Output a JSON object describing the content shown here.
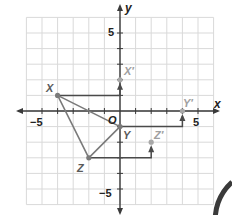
{
  "figure": {
    "axes": {
      "x_label": "x",
      "y_label": "y",
      "origin_label": "O",
      "x_range": [
        -6,
        6
      ],
      "y_range": [
        -6,
        6
      ],
      "tick_labels": {
        "x_neg": "−5",
        "x_pos": "5",
        "y_pos": "5",
        "y_neg": "−5"
      }
    },
    "preimage": {
      "name": "triangle XYZ",
      "points": [
        {
          "label": "X",
          "x": -4,
          "y": 1
        },
        {
          "label": "Y",
          "x": 0,
          "y": -1
        },
        {
          "label": "Z",
          "x": -2,
          "y": -3
        }
      ]
    },
    "image": {
      "points": [
        {
          "label": "X′",
          "x": 0,
          "y": 2
        },
        {
          "label": "Y′",
          "x": 4,
          "y": 0
        },
        {
          "label": "Z′",
          "x": 2,
          "y": -2
        }
      ]
    },
    "translation": {
      "horizontal": 4,
      "vertical": 1,
      "description": "4 units right, 1 unit up"
    },
    "colors": {
      "grid": "#d9d9d9",
      "axis": "#3a3a3a",
      "triangle": "#7a7a7a",
      "image_point": "#a8a8a8",
      "path": "#4a4a4a",
      "label": "#5a5a5a",
      "image_label": "#a0a0a0"
    }
  }
}
